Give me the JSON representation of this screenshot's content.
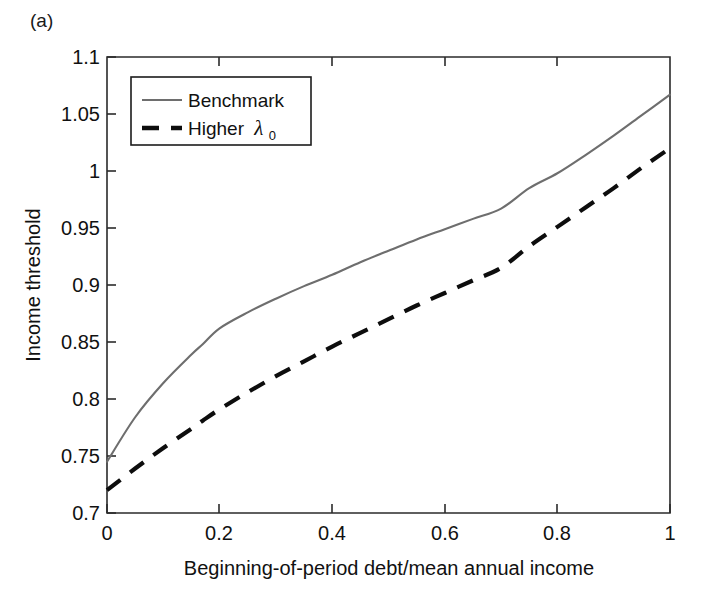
{
  "panel": {
    "label": "(a)"
  },
  "chart_data": {
    "type": "line",
    "title": "",
    "xlabel": "Beginning-of-period debt/mean annual income",
    "ylabel": "Income threshold",
    "xlim": [
      0,
      1
    ],
    "ylim": [
      0.7,
      1.1
    ],
    "xticks": [
      "0",
      "0.2",
      "0.4",
      "0.6",
      "0.8",
      "1"
    ],
    "xtick_values": [
      0,
      0.2,
      0.4,
      0.6,
      0.8,
      1
    ],
    "yticks": [
      "0.7",
      "0.75",
      "0.8",
      "0.85",
      "0.9",
      "0.95",
      "1",
      "1.05",
      "1.1"
    ],
    "ytick_values": [
      0.7,
      0.75,
      0.8,
      0.85,
      0.9,
      0.95,
      1,
      1.05,
      1.1
    ],
    "grid": false,
    "legend_position": "upper left",
    "x": [
      0,
      0.05,
      0.1,
      0.15,
      0.17,
      0.2,
      0.25,
      0.3,
      0.35,
      0.4,
      0.45,
      0.5,
      0.55,
      0.6,
      0.65,
      0.7,
      0.75,
      0.8,
      0.85,
      0.9,
      0.95,
      1
    ],
    "series": [
      {
        "name": "Benchmark",
        "style": "solid",
        "color": "#6e6e6e",
        "values": [
          0.745,
          0.784,
          0.814,
          0.839,
          0.848,
          0.862,
          0.876,
          0.888,
          0.899,
          0.909,
          0.92,
          0.93,
          0.94,
          0.949,
          0.958,
          0.967,
          0.985,
          0.998,
          1.014,
          1.031,
          1.049,
          1.067
        ]
      },
      {
        "name": "Higher λ₀",
        "style": "dashed",
        "color": "#0d0d0d",
        "values": [
          0.72,
          0.739,
          0.757,
          0.774,
          0.781,
          0.791,
          0.806,
          0.82,
          0.833,
          0.846,
          0.858,
          0.87,
          0.882,
          0.893,
          0.904,
          0.915,
          0.934,
          0.951,
          0.968,
          0.985,
          1.003,
          1.02
        ]
      }
    ]
  },
  "legend": {
    "entries": [
      {
        "label": "Benchmark",
        "symbol": "solid-line"
      },
      {
        "label": "Higher",
        "symbol": "dashed-line",
        "math_base": "λ",
        "math_sub": "0"
      }
    ]
  }
}
